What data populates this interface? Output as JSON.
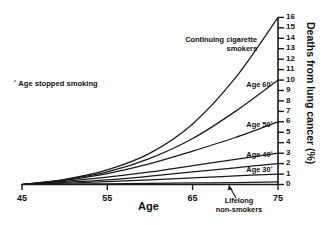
{
  "chart_data": {
    "type": "line",
    "title": "",
    "xlabel": "Age",
    "ylabel": "Deaths from lung cancer (%)",
    "xlim": [
      45,
      75
    ],
    "ylim": [
      0,
      16
    ],
    "xticks": [
      "45",
      "55",
      "65",
      "75"
    ],
    "xtick_values": [
      45,
      55,
      65,
      75
    ],
    "yticks": [
      "0",
      "1",
      "2",
      "3",
      "4",
      "5",
      "6",
      "7",
      "8",
      "9",
      "10",
      "11",
      "12",
      "13",
      "14",
      "15",
      "16"
    ],
    "ytick_values": [
      0,
      1,
      2,
      3,
      4,
      5,
      6,
      7,
      8,
      9,
      10,
      11,
      12,
      13,
      14,
      15,
      16
    ],
    "grid": false,
    "legend_position": "inline-labels",
    "x": [
      45,
      50,
      55,
      60,
      65,
      70,
      75
    ],
    "series": [
      {
        "name": "Continuing cigarette smokers",
        "label": "Continuing cigarette\nsmokers",
        "values": [
          0.0,
          0.5,
          1.4,
          3.0,
          5.8,
          10.2,
          16.0
        ]
      },
      {
        "name": "Age 60*",
        "label": "Age 60˚",
        "values": [
          0.0,
          0.45,
          1.2,
          2.5,
          4.4,
          7.0,
          10.0
        ]
      },
      {
        "name": "Age 50*",
        "label": "Age 50˚",
        "values": [
          0.0,
          0.4,
          1.05,
          2.0,
          3.2,
          4.5,
          6.0
        ]
      },
      {
        "name": "Age 40*",
        "label": "Age 40˚",
        "values": [
          0.0,
          0.3,
          0.7,
          1.2,
          1.8,
          2.4,
          3.0
        ]
      },
      {
        "name": "Age 30*",
        "label": "Age 30˚",
        "values": [
          0.0,
          0.2,
          0.45,
          0.8,
          1.2,
          1.6,
          2.0
        ]
      },
      {
        "name": "unlabeled-low-curve",
        "label": "",
        "values": [
          0.0,
          0.12,
          0.27,
          0.45,
          0.64,
          0.82,
          1.0
        ]
      },
      {
        "name": "Lifelong non-smokers",
        "label": "Lifelong\nnon-smokers",
        "values": [
          0.0,
          0.03,
          0.07,
          0.11,
          0.15,
          0.19,
          0.24
        ]
      }
    ],
    "annotations": [
      {
        "name": "footnote",
        "text": "˚ Age stopped smoking"
      }
    ]
  },
  "labels": {
    "continuing_line1": "Continuing cigarette",
    "continuing_line2": "smokers",
    "age60": "Age 60˚",
    "age50": "Age 50˚",
    "age40": "Age 40˚",
    "age30": "Age 30˚",
    "lifelong_line1": "Lifelong",
    "lifelong_line2": "non-smokers",
    "footnote": "˚ Age stopped smoking",
    "xaxis": "Age",
    "yaxis": "Deaths from lung cancer (%)"
  },
  "ticks": {
    "x": [
      "45",
      "55",
      "65",
      "75"
    ],
    "y16": "16",
    "y15": "15",
    "y14": "14",
    "y13": "13",
    "y12": "12",
    "y11": "11",
    "y10": "10",
    "y9": "9",
    "y8": "8",
    "y7": "7",
    "y6": "6",
    "y5": "5",
    "y4": "4",
    "y3": "3",
    "y2": "2",
    "y1": "1",
    "y0": "0"
  },
  "colors": {
    "line": "#1a1a1a",
    "axis": "#1a1a1a",
    "background": "#ffffff",
    "text": "#111111"
  }
}
